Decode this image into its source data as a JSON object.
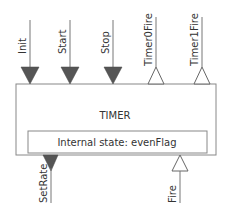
{
  "diagram": {
    "block": {
      "title": "TIMER",
      "internal_state": "Internal state: evenFlag"
    },
    "inputs_top": [
      {
        "label": "Init",
        "type": "input",
        "style": "filled-triangle"
      },
      {
        "label": "Start",
        "type": "input",
        "style": "filled-triangle"
      },
      {
        "label": "Stop",
        "type": "input",
        "style": "filled-triangle"
      }
    ],
    "outputs_top": [
      {
        "label": "Timer0Fire",
        "type": "output",
        "style": "hollow-triangle"
      },
      {
        "label": "Timer1Fire",
        "type": "output",
        "style": "hollow-triangle"
      }
    ],
    "bottom_ports": [
      {
        "label": "SetRate",
        "type": "input",
        "style": "filled-triangle"
      },
      {
        "label": "Fire",
        "type": "output",
        "style": "hollow-triangle"
      }
    ],
    "colors": {
      "filled_port": "#555555",
      "line": "#777777",
      "box_border": "#888888",
      "text": "#333333"
    }
  }
}
